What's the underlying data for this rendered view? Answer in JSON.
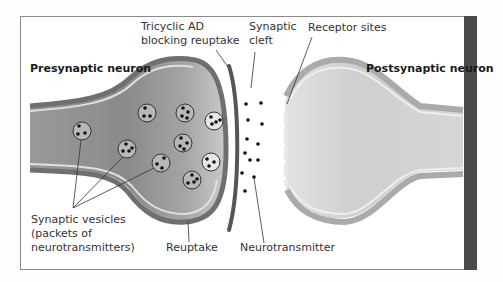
{
  "diagram": {
    "labels": {
      "presynaptic": "Presynaptic neuron",
      "postsynaptic": "Postsynaptic neuron",
      "tricyclic_line1": "Tricyclic AD",
      "tricyclic_line2": "blocking reuptake",
      "cleft_line1": "Synaptic",
      "cleft_line2": "cleft",
      "receptor": "Receptor sites",
      "vesicles_line1": "Synaptic vesicles",
      "vesicles_line2": "(packets of",
      "vesicles_line3": "neurotransmitters)",
      "reuptake": "Reuptake",
      "neurotransmitter": "Neurotransmitter"
    },
    "colors": {
      "presynaptic_fill": "#8e8e8e",
      "membrane": "#6f6f6f",
      "membrane_highlight": "#d9d9d9",
      "postsynaptic_fill": "#cfcfcf",
      "blocker": "#555555",
      "dot": "#111111",
      "side_bar": "#4a4a4a"
    }
  }
}
